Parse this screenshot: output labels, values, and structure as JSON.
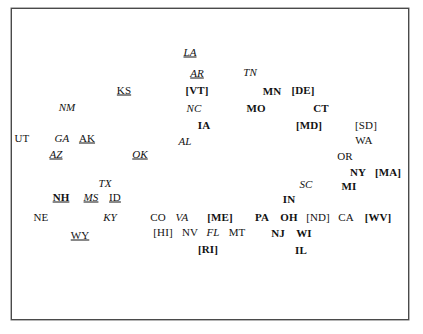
{
  "figure": {
    "background_color": "#ffffff",
    "frame_color": "#4a4a4a",
    "text_color": "#121212",
    "width": 423,
    "height": 334
  },
  "chart_data": {
    "type": "scatter",
    "title": "",
    "subtitle": "",
    "xlabel": "",
    "ylabel": "",
    "xlim": [
      0,
      423
    ],
    "ylim": [
      0,
      334
    ],
    "grid": false,
    "legend": null,
    "axis_ticks": [],
    "note": "Text-label scatter plot of US state postal abbreviations. Styles encode groups: bold, italic, underline, and bracketed labels.",
    "style_groups": [
      {
        "name": "plain",
        "description": "upright regular text"
      },
      {
        "name": "bold",
        "description": "upright bold text"
      },
      {
        "name": "italic",
        "description": "italic text"
      },
      {
        "name": "italic-underline",
        "description": "italic underlined text"
      },
      {
        "name": "plain-underline",
        "description": "upright regular underlined text"
      },
      {
        "name": "bold-underline",
        "description": "upright bold underlined text"
      },
      {
        "name": "bracket-plain",
        "description": "plain text enclosed in square brackets"
      },
      {
        "name": "bracket-bold",
        "description": "bold text enclosed in square brackets"
      }
    ],
    "points": [
      {
        "label": "LA",
        "x": 189,
        "y": 51,
        "style": "italic-underline"
      },
      {
        "label": "AR",
        "x": 196,
        "y": 72,
        "style": "italic-underline"
      },
      {
        "label": "TN",
        "x": 249,
        "y": 71,
        "style": "italic"
      },
      {
        "label": "KS",
        "x": 123,
        "y": 89,
        "style": "plain-underline"
      },
      {
        "label": "[VT]",
        "x": 196,
        "y": 89,
        "style": "bracket-bold"
      },
      {
        "label": "MN",
        "x": 271,
        "y": 90,
        "style": "bold"
      },
      {
        "label": "[DE]",
        "x": 302,
        "y": 89,
        "style": "bracket-bold"
      },
      {
        "label": "NM",
        "x": 66,
        "y": 106,
        "style": "italic"
      },
      {
        "label": "NC",
        "x": 193,
        "y": 107,
        "style": "italic"
      },
      {
        "label": "MO",
        "x": 255,
        "y": 107,
        "style": "bold"
      },
      {
        "label": "CT",
        "x": 320,
        "y": 107,
        "style": "bold"
      },
      {
        "label": "IA",
        "x": 203,
        "y": 124,
        "style": "bold"
      },
      {
        "label": "[MD]",
        "x": 308,
        "y": 124,
        "style": "bracket-bold"
      },
      {
        "label": "[SD]",
        "x": 365,
        "y": 124,
        "style": "bracket-plain"
      },
      {
        "label": "UT",
        "x": 21,
        "y": 137,
        "style": "plain"
      },
      {
        "label": "GA",
        "x": 61,
        "y": 137,
        "style": "italic"
      },
      {
        "label": "AK",
        "x": 86,
        "y": 137,
        "style": "plain-underline"
      },
      {
        "label": "AL",
        "x": 184,
        "y": 140,
        "style": "italic"
      },
      {
        "label": "WA",
        "x": 363,
        "y": 139,
        "style": "plain"
      },
      {
        "label": "AZ",
        "x": 55,
        "y": 153,
        "style": "italic-underline"
      },
      {
        "label": "OK",
        "x": 139,
        "y": 153,
        "style": "italic-underline"
      },
      {
        "label": "OR",
        "x": 344,
        "y": 155,
        "style": "plain"
      },
      {
        "label": "NY",
        "x": 357,
        "y": 171,
        "style": "bold"
      },
      {
        "label": "[MA]",
        "x": 387,
        "y": 171,
        "style": "bracket-bold"
      },
      {
        "label": "TX",
        "x": 104,
        "y": 182,
        "style": "italic"
      },
      {
        "label": "SC",
        "x": 305,
        "y": 183,
        "style": "italic"
      },
      {
        "label": "MI",
        "x": 348,
        "y": 185,
        "style": "bold"
      },
      {
        "label": "NH",
        "x": 60,
        "y": 196,
        "style": "bold-underline"
      },
      {
        "label": "MS",
        "x": 90,
        "y": 196,
        "style": "italic-underline"
      },
      {
        "label": "ID",
        "x": 114,
        "y": 196,
        "style": "plain-underline"
      },
      {
        "label": "IN",
        "x": 288,
        "y": 198,
        "style": "bold"
      },
      {
        "label": "NE",
        "x": 40,
        "y": 216,
        "style": "plain"
      },
      {
        "label": "KY",
        "x": 109,
        "y": 216,
        "style": "italic"
      },
      {
        "label": "CO",
        "x": 157,
        "y": 216,
        "style": "plain"
      },
      {
        "label": "VA",
        "x": 181,
        "y": 216,
        "style": "italic"
      },
      {
        "label": "[ME]",
        "x": 219,
        "y": 216,
        "style": "bracket-bold"
      },
      {
        "label": "PA",
        "x": 261,
        "y": 216,
        "style": "bold"
      },
      {
        "label": "OH",
        "x": 288,
        "y": 216,
        "style": "bold"
      },
      {
        "label": "[ND]",
        "x": 317,
        "y": 216,
        "style": "bracket-plain"
      },
      {
        "label": "CA",
        "x": 345,
        "y": 216,
        "style": "plain"
      },
      {
        "label": "[WV]",
        "x": 377,
        "y": 216,
        "style": "bracket-bold"
      },
      {
        "label": "WY",
        "x": 79,
        "y": 234,
        "style": "plain-underline"
      },
      {
        "label": "[HI]",
        "x": 162,
        "y": 231,
        "style": "bracket-plain"
      },
      {
        "label": "NV",
        "x": 189,
        "y": 231,
        "style": "plain"
      },
      {
        "label": "FL",
        "x": 212,
        "y": 231,
        "style": "italic"
      },
      {
        "label": "MT",
        "x": 236,
        "y": 231,
        "style": "plain"
      },
      {
        "label": "NJ",
        "x": 277,
        "y": 232,
        "style": "bold"
      },
      {
        "label": "WI",
        "x": 303,
        "y": 232,
        "style": "bold"
      },
      {
        "label": "[RI]",
        "x": 207,
        "y": 248,
        "style": "bracket-bold"
      },
      {
        "label": "IL",
        "x": 300,
        "y": 249,
        "style": "bold"
      }
    ]
  }
}
